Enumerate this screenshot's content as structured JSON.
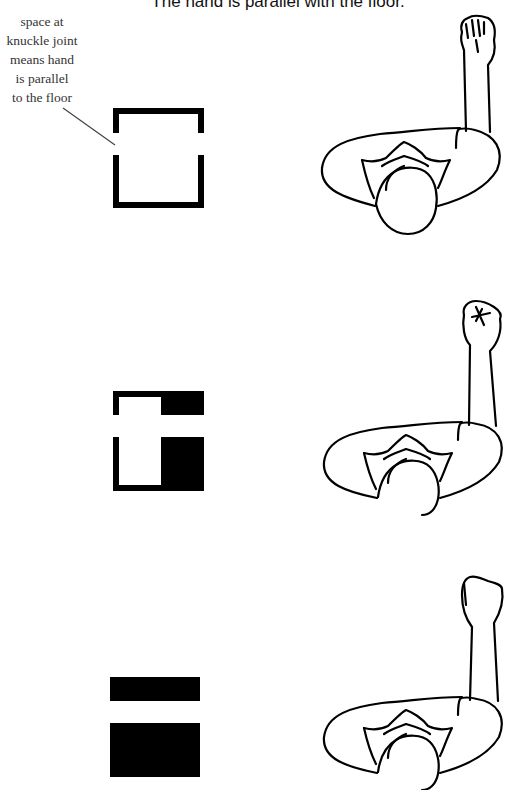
{
  "title": "The hand is parallel with the floor.",
  "annotation": {
    "lines": [
      "space at",
      "knuckle joint",
      "means hand",
      "is parallel",
      "to the floor"
    ]
  },
  "rows": [
    {
      "icon": "open-bracket-square",
      "fill": "none",
      "figure": "top-view-arm-raised-fist-level"
    },
    {
      "icon": "half-filled-square",
      "fill": "right-half",
      "figure": "top-view-arm-raised-fist-tilted"
    },
    {
      "icon": "filled-split-square",
      "fill": "full",
      "figure": "top-view-arm-raised-fist-dropped"
    }
  ],
  "colors": {
    "ink": "#000000",
    "text": "#333333",
    "background": "#ffffff"
  }
}
